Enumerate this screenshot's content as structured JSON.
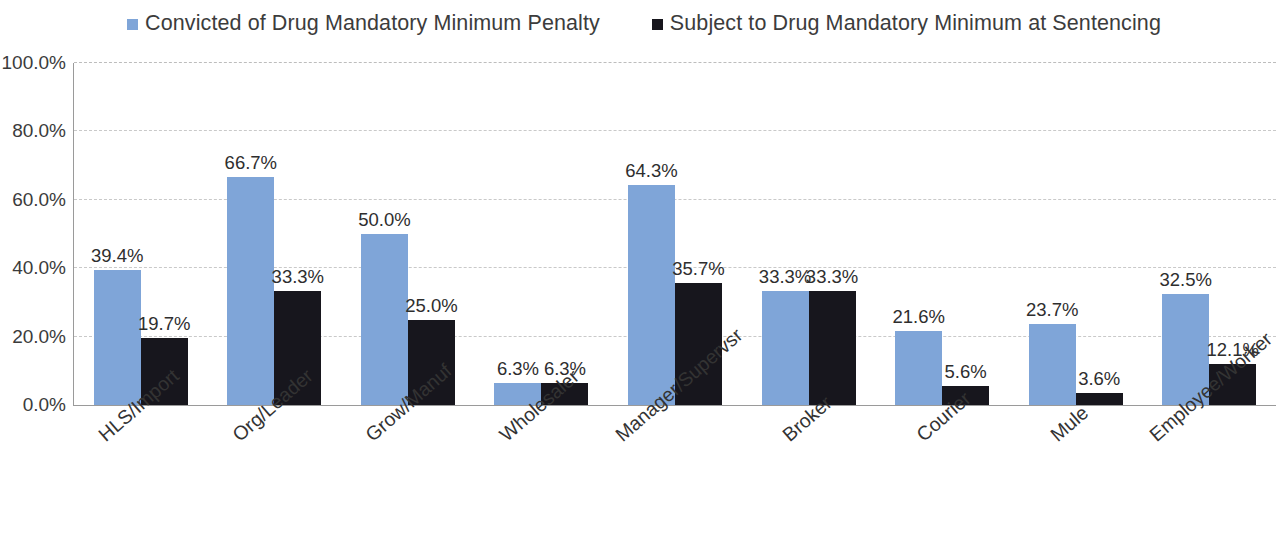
{
  "legend": {
    "entries": [
      {
        "label": "Convicted of Drug Mandatory Minimum Penalty",
        "color": "#7FA5D8",
        "icon": "square-marker-icon"
      },
      {
        "label": "Subject to Drug Mandatory Minimum at Sentencing",
        "color": "#17161d",
        "icon": "square-marker-icon"
      }
    ]
  },
  "axis": {
    "y_ticks": [
      "0.0%",
      "20.0%",
      "40.0%",
      "60.0%",
      "80.0%",
      "100.0%"
    ]
  },
  "chart_data": {
    "type": "bar",
    "title": "",
    "subtitle": "",
    "xlabel": "",
    "ylabel": "",
    "ylim": [
      0,
      100
    ],
    "ytick_values": [
      0,
      20,
      40,
      60,
      80,
      100
    ],
    "ytick_labels": [
      "0.0%",
      "20.0%",
      "40.0%",
      "60.0%",
      "80.0%",
      "100.0%"
    ],
    "grid": true,
    "grid_axis": "y",
    "grid_style": "dashed",
    "legend_position": "top-center",
    "value_label_format": "0.0%",
    "categories": [
      "HLS/Import",
      "Org/Leader",
      "Grow/Manuf",
      "Wholesaler",
      "Manager/Supervsr",
      "Broker",
      "Courier",
      "Mule",
      "Employee/Worker"
    ],
    "series": [
      {
        "name": "Convicted of Drug Mandatory Minimum Penalty",
        "color": "#7FA5D8",
        "values": [
          39.4,
          66.7,
          50.0,
          6.3,
          64.3,
          33.3,
          21.6,
          23.7,
          32.5
        ],
        "labels": [
          "39.4%",
          "66.7%",
          "50.0%",
          "6.3%",
          "64.3%",
          "33.3%",
          "21.6%",
          "23.7%",
          "32.5%"
        ]
      },
      {
        "name": "Subject to Drug Mandatory Minimum at Sentencing",
        "color": "#17161d",
        "values": [
          19.7,
          33.3,
          25.0,
          6.3,
          35.7,
          33.3,
          5.6,
          3.6,
          12.1
        ],
        "labels": [
          "19.7%",
          "33.3%",
          "25.0%",
          "6.3%",
          "35.7%",
          "33.3%",
          "5.6%",
          "3.6%",
          "12.1%"
        ]
      }
    ]
  }
}
